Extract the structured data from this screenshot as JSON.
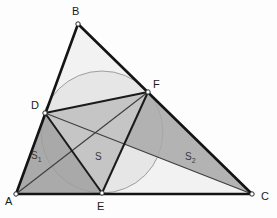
{
  "figure": {
    "canvas": {
      "width": 277,
      "height": 218,
      "background": "#fdfdfd"
    },
    "colors": {
      "stroke": "#1a1a1a",
      "thin_stroke": "#4a4a4a",
      "circle_stroke": "#9a9a9a",
      "circle_fill": "#e3e3e3",
      "region_s1": "#9e9e9e",
      "region_s": "#d2d2d2",
      "region_s2": "#a8a8a8",
      "region_dfe": "#8d8d8d",
      "triangle_fill": "#f2f2f2",
      "vertex_marker": "#ffffff",
      "label_text": "#1a1a1a",
      "region_label_text": "#3a3a3a"
    },
    "vertices": [
      {
        "id": "A",
        "label": "A",
        "x": 16,
        "y": 194,
        "label_x": 5,
        "label_y": 196
      },
      {
        "id": "B",
        "label": "B",
        "x": 78,
        "y": 24,
        "label_x": 72,
        "label_y": 6
      },
      {
        "id": "C",
        "label": "C",
        "x": 252,
        "y": 194,
        "label_x": 261,
        "label_y": 191
      },
      {
        "id": "D",
        "label": "D",
        "x": 45,
        "y": 113,
        "label_x": 31,
        "label_y": 100
      },
      {
        "id": "E",
        "label": "E",
        "x": 102,
        "y": 193,
        "label_x": 97,
        "label_y": 201
      },
      {
        "id": "F",
        "label": "F",
        "x": 148,
        "y": 92,
        "label_x": 153,
        "label_y": 79
      }
    ],
    "incircle": {
      "cx": 102,
      "cy": 132,
      "r": 61
    },
    "region_labels": [
      {
        "id": "S1",
        "text": "S",
        "sub": "1",
        "x": 31,
        "y": 151
      },
      {
        "id": "S",
        "text": "S",
        "sub": "",
        "x": 95,
        "y": 152
      },
      {
        "id": "S2",
        "text": "S",
        "sub": "2",
        "x": 185,
        "y": 152
      }
    ],
    "regions": [
      {
        "id": "triangle-abc",
        "name": "outer-triangle",
        "points": "16,194 78,24 252,194"
      },
      {
        "id": "region-s1",
        "name": "region-S1",
        "points": "16,194 45,113 148,92 102,193"
      },
      {
        "id": "region-s",
        "name": "region-S",
        "points": "45,113 148,92 102,193"
      },
      {
        "id": "region-s2",
        "name": "region-S2",
        "points": "45,113 148,92 252,194"
      }
    ],
    "segments": [
      {
        "id": "AB",
        "name": "side-AB",
        "x1": 16,
        "y1": 194,
        "x2": 78,
        "y2": 24,
        "weight": "thick"
      },
      {
        "id": "BC",
        "name": "side-BC",
        "x1": 78,
        "y1": 24,
        "x2": 252,
        "y2": 194,
        "weight": "thick"
      },
      {
        "id": "AC",
        "name": "side-AC",
        "x1": 16,
        "y1": 194,
        "x2": 252,
        "y2": 194,
        "weight": "thick"
      },
      {
        "id": "DF",
        "name": "chord-DF",
        "x1": 45,
        "y1": 113,
        "x2": 148,
        "y2": 92,
        "weight": "thick"
      },
      {
        "id": "DE",
        "name": "chord-DE",
        "x1": 45,
        "y1": 113,
        "x2": 102,
        "y2": 193,
        "weight": "thick"
      },
      {
        "id": "EF",
        "name": "chord-EF",
        "x1": 102,
        "y1": 193,
        "x2": 148,
        "y2": 92,
        "weight": "thick"
      },
      {
        "id": "AF",
        "name": "cevian-AF",
        "x1": 16,
        "y1": 194,
        "x2": 148,
        "y2": 92,
        "weight": "thin"
      },
      {
        "id": "DC",
        "name": "cevian-DC",
        "x1": 45,
        "y1": 113,
        "x2": 252,
        "y2": 194,
        "weight": "thin"
      }
    ]
  }
}
